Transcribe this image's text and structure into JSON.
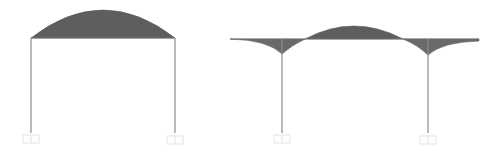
{
  "diagram": {
    "type": "bending-moment-diagrams",
    "colors": {
      "fill": "#5e5e5e",
      "member": "#8c8c8c",
      "support": "#e6e6e6",
      "background": "#ffffff"
    },
    "frames": [
      {
        "id": "portal-frame",
        "beam": {
          "x1": 31,
          "x2": 175,
          "y": 38
        },
        "columns": [
          {
            "x": 31,
            "top": 38,
            "bottom": 133
          },
          {
            "x": 175,
            "top": 38,
            "bottom": 133
          }
        ],
        "moment_peak": {
          "x": 103,
          "y": 10
        },
        "supports": [
          {
            "x": 31,
            "y": 135
          },
          {
            "x": 175,
            "y": 135
          }
        ]
      },
      {
        "id": "frame-with-overhangs",
        "beam": {
          "x1": 230,
          "x2": 479,
          "y": 39
        },
        "columns": [
          {
            "x": 282,
            "top": 39,
            "bottom": 133
          },
          {
            "x": 428,
            "top": 39,
            "bottom": 133
          }
        ],
        "moment_peak": {
          "x": 354,
          "y": 26
        },
        "cusps": [
          {
            "x": 282,
            "y": 54
          },
          {
            "x": 428,
            "y": 55
          }
        ],
        "supports": [
          {
            "x": 282,
            "y": 135
          },
          {
            "x": 428,
            "y": 135
          }
        ]
      }
    ]
  }
}
